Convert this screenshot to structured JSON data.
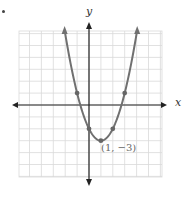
{
  "figure": {
    "marker": "•",
    "x_axis_label": "x",
    "y_axis_label": "y",
    "vertex_label": "(1, −3)"
  },
  "chart_data": {
    "type": "line",
    "title": "",
    "xlabel": "x",
    "ylabel": "y",
    "function": "y = (x - 1)^2 - 3",
    "xlim": [
      -6,
      6
    ],
    "ylim": [
      -6,
      6
    ],
    "grid": true,
    "grid_step": 1,
    "vertex": {
      "x": 1,
      "y": -3,
      "label": "(1, −3)"
    },
    "points": [
      {
        "x": -1,
        "y": 1
      },
      {
        "x": 0,
        "y": -2
      },
      {
        "x": 1,
        "y": -3
      },
      {
        "x": 2,
        "y": -2
      },
      {
        "x": 3,
        "y": 1
      }
    ],
    "curve_arrows": true,
    "colors": {
      "curve": "#707070",
      "axes": "#222222",
      "grid": "#d9d9d9",
      "points": "#666666"
    }
  }
}
